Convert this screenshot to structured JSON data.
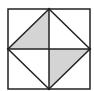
{
  "diagram": {
    "type": "geometric-figure",
    "colors": {
      "background": "#ffffff",
      "stroke": "#222222",
      "shade": "#d4d4d4"
    },
    "points": {
      "top_left": [
        8,
        9
      ],
      "top_right": [
        90,
        9
      ],
      "bottom_right": [
        90,
        89
      ],
      "bottom_left": [
        8,
        89
      ],
      "top_mid": [
        49,
        9
      ],
      "right_mid": [
        90,
        49
      ],
      "bottom_mid": [
        49,
        89
      ],
      "left_mid": [
        8,
        49
      ],
      "center": [
        49,
        49
      ]
    },
    "shaded_regions": [
      {
        "name": "upper-left-inner-triangle",
        "vertices": [
          "left_mid",
          "top_mid",
          "center"
        ]
      },
      {
        "name": "lower-right-inner-triangle",
        "vertices": [
          "center",
          "right_mid",
          "bottom_mid"
        ]
      }
    ]
  }
}
